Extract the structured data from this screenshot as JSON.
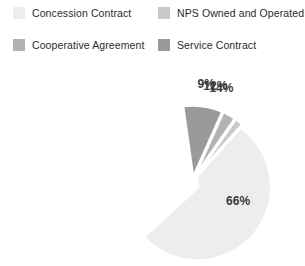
{
  "legend": {
    "items": [
      {
        "label": "Concession Contract",
        "color": "#ededed",
        "swatch_name": "legend-swatch-concession-contract"
      },
      {
        "label": "NPS Owned and Operated",
        "color": "#c9c9c9",
        "swatch_name": "legend-swatch-nps-owned-and-operated"
      },
      {
        "label": "Cooperative Agreement",
        "color": "#b3b3b3",
        "swatch_name": "legend-swatch-cooperative-agreement"
      },
      {
        "label": "Service Contract",
        "color": "#9a9a9a",
        "swatch_name": "legend-swatch-service-contract"
      }
    ]
  },
  "chart_data": {
    "type": "pie",
    "title": "",
    "subtitle": "",
    "xlabel": "",
    "ylabel": "",
    "grid": false,
    "legend_position": "top",
    "exploded": true,
    "value_suffix": "%",
    "categories": [
      "Concession Contract",
      "NPS Owned and Operated",
      "Cooperative Agreement",
      "Service Contract"
    ],
    "values": [
      66,
      14,
      12,
      9
    ],
    "labels": [
      "66%",
      "14%",
      "12%",
      "9%"
    ],
    "colors": [
      "#ededed",
      "#c9c9c9",
      "#b3b3b3",
      "#9a9a9a"
    ],
    "slices": [
      {
        "category": "Concession Contract",
        "value": 66,
        "label": "66%",
        "color": "#ededed"
      },
      {
        "category": "NPS Owned and Operated",
        "value": 14,
        "label": "14%",
        "color": "#c9c9c9"
      },
      {
        "category": "Cooperative Agreement",
        "value": 12,
        "label": "12%",
        "color": "#b3b3b3"
      },
      {
        "category": "Service Contract",
        "value": 9,
        "label": "9%",
        "color": "#9a9a9a"
      }
    ]
  },
  "geometry": {
    "center_x": 192,
    "center_y": 123,
    "radius": 74,
    "explode_offset": 6,
    "start_angle_deg": -8
  }
}
